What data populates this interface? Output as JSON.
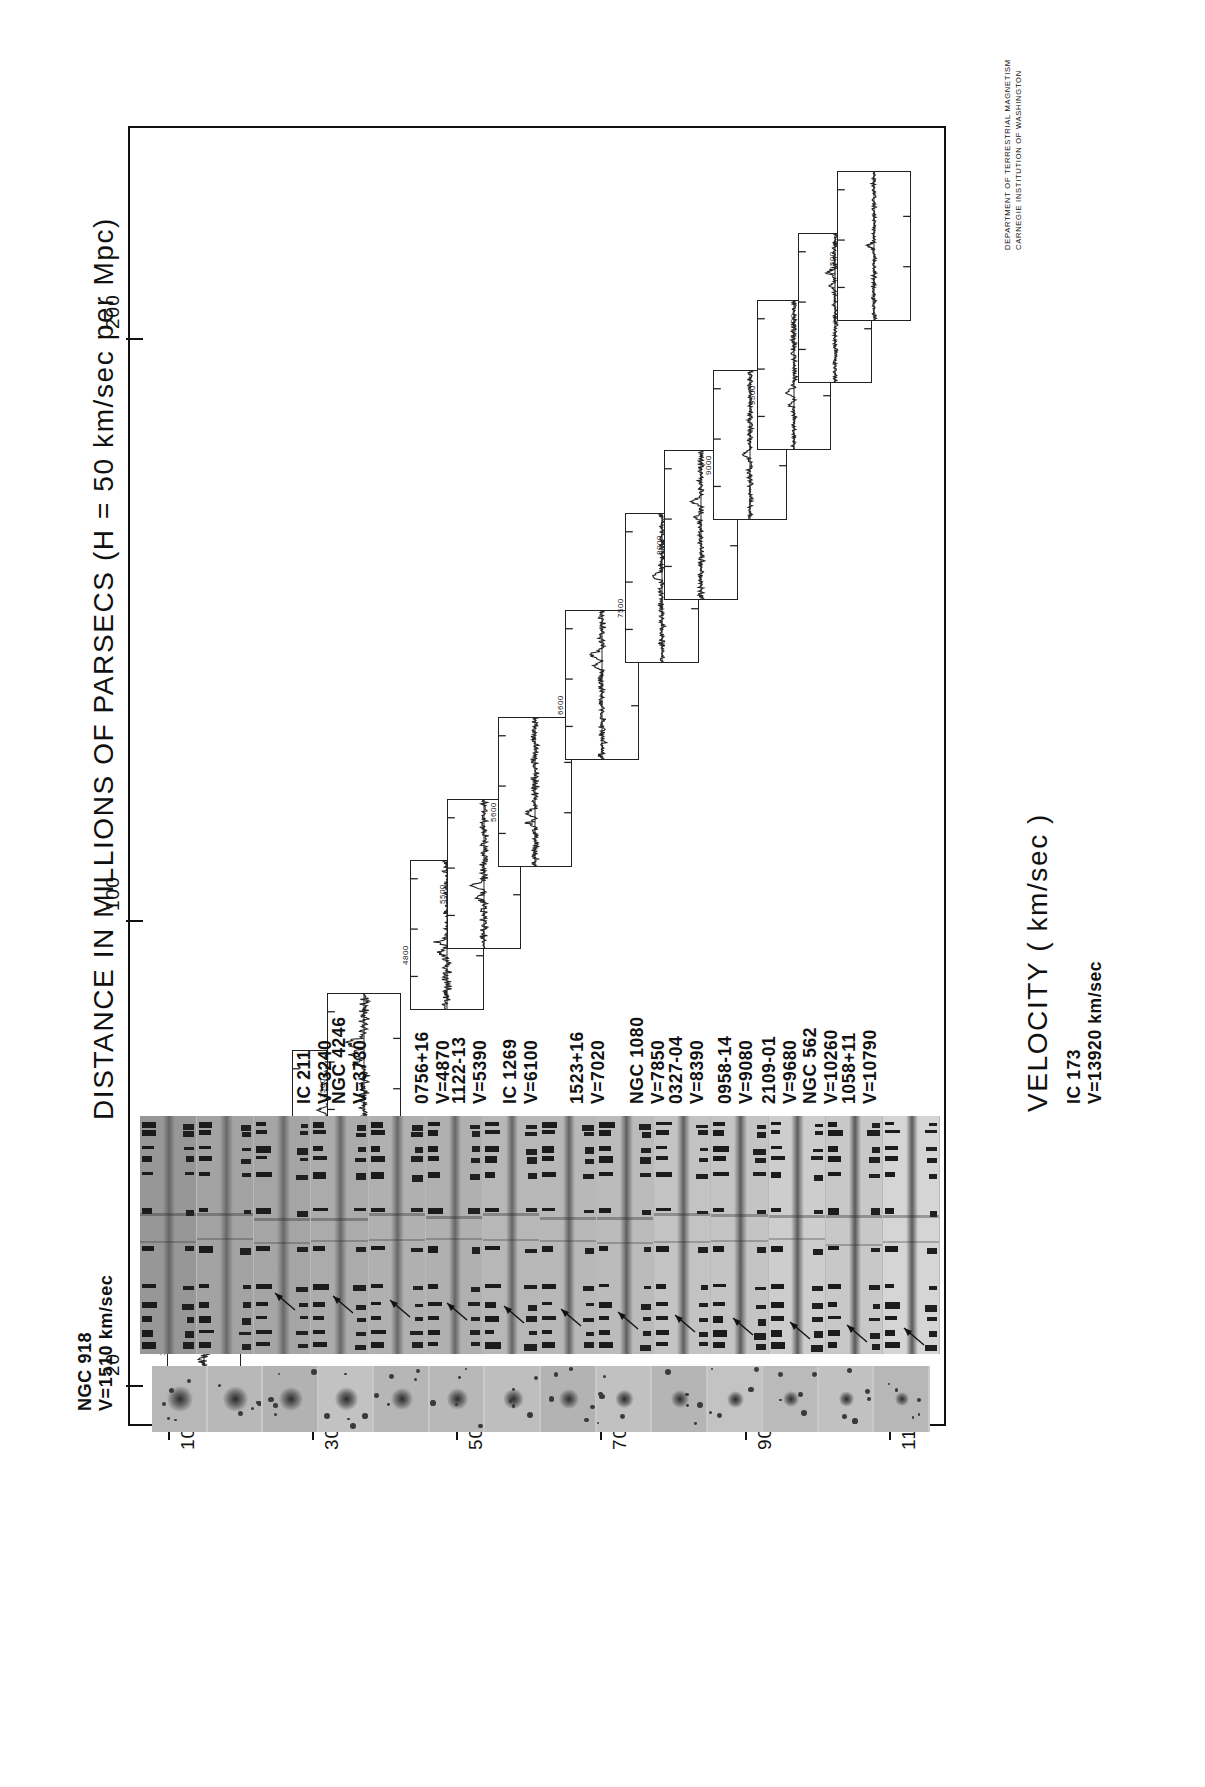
{
  "figure": {
    "y_axis_title": "DISTANCE IN MILLIONS OF PARSECS  (H = 50 km/sec per Mpc)",
    "x_axis_title": "VELOCITY   ( km/sec )",
    "credit_line_1": "DEPARTMENT OF TERRESTRIAL MAGNETISM",
    "credit_line_2": "CARNEGIE INSTITUTION OF WASHINGTON"
  },
  "chart_data": {
    "type": "scatter",
    "title": "DISTANCE IN MILLIONS OF PARSECS  (H = 50 km/sec per Mpc)",
    "xlabel": "VELOCITY   ( km/sec )",
    "ylabel": "DISTANCE IN MILLIONS OF PARSECS  (H = 50 km/sec per Mpc)",
    "x": [
      1510,
      3240,
      3730,
      4870,
      5390,
      6100,
      7020,
      7850,
      8390,
      9080,
      9680,
      10260,
      10790,
      13920
    ],
    "y": [
      30.2,
      64.8,
      74.6,
      97.4,
      107.8,
      122.0,
      140.4,
      157.0,
      167.8,
      181.6,
      193.6,
      205.2,
      215.8,
      278.4
    ],
    "xticks": [
      1000,
      3000,
      5000,
      7000,
      9000,
      11000
    ],
    "xticklabels": [
      "1000",
      "3000",
      "5000",
      "7000",
      "9000",
      "11000"
    ],
    "yticks": [
      20,
      100,
      200
    ],
    "yticklabels": [
      "20",
      "100",
      "200"
    ],
    "xlim": [
      700,
      11600
    ],
    "ylim": [
      14,
      232
    ],
    "grid": false,
    "legend": false,
    "note": "Each plotted point is replaced by an inset spectrum panel of the galaxy; panels ascend left-to-right along the Hubble relation."
  },
  "galaxies": [
    {
      "name": "NGC 918",
      "velocity_label": "V=1510 km/sec",
      "velocity": 1510,
      "spec_tick_label": "1500",
      "first": true
    },
    {
      "name": "IC 211",
      "velocity_label": "V=3240",
      "velocity": 3240,
      "spec_tick_label": "3000"
    },
    {
      "name": "NGC 4246",
      "velocity_label": "V=3730",
      "velocity": 3730,
      "spec_tick_label": "3500"
    },
    {
      "name": "0756+16",
      "velocity_label": "V=4870",
      "velocity": 4870,
      "spec_tick_label": "4800"
    },
    {
      "name": "1122-13",
      "velocity_label": "V=5390",
      "velocity": 5390,
      "spec_tick_label": "5500"
    },
    {
      "name": "IC 1269",
      "velocity_label": "V=6100",
      "velocity": 6100,
      "spec_tick_label": "5600"
    },
    {
      "name": "1523+16",
      "velocity_label": "V=7020",
      "velocity": 7020,
      "spec_tick_label": "6600"
    },
    {
      "name": "NGC 1080",
      "velocity_label": "V=7850",
      "velocity": 7850,
      "spec_tick_label": "7500"
    },
    {
      "name": "0327-04",
      "velocity_label": "V=8390",
      "velocity": 8390,
      "spec_tick_label": "8000"
    },
    {
      "name": "0958-14",
      "velocity_label": "V=9080",
      "velocity": 9080,
      "spec_tick_label": "9000"
    },
    {
      "name": "2109-01",
      "velocity_label": "V=9680",
      "velocity": 9680,
      "spec_tick_label": "9500"
    },
    {
      "name": "NGC 562",
      "velocity_label": "V=10260",
      "velocity": 10260,
      "spec_tick_label": "10000"
    },
    {
      "name": "1058+11",
      "velocity_label": "V=10790",
      "velocity": 10790,
      "spec_tick_label": "10500"
    },
    {
      "name": "IC 173",
      "velocity_label": "V=13920 km/sec",
      "velocity": 13920,
      "spec_tick_label": "10900"
    }
  ]
}
